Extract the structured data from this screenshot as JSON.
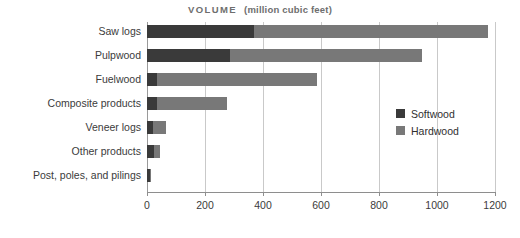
{
  "chart_data": {
    "type": "bar",
    "orientation": "horizontal",
    "stacked": true,
    "title_main": "VOLUME",
    "title_sub": "(million cubic feet)",
    "xlabel": "",
    "ylabel": "",
    "xlim": [
      0,
      1200
    ],
    "xticks": [
      0,
      200,
      400,
      600,
      800,
      1000,
      1200
    ],
    "xtick_labels": [
      "0",
      "200",
      "400",
      "600",
      "800",
      "1000",
      "1200"
    ],
    "grid": "vertical",
    "legend_position": "center-right",
    "categories": [
      "Saw logs",
      "Pulpwood",
      "Fuelwood",
      "Composite products",
      "Veneer logs",
      "Other products",
      "Post, poles, and pilings"
    ],
    "series": [
      {
        "name": "Softwood",
        "color": "#3a3a3a",
        "values": [
          370,
          285,
          35,
          35,
          20,
          25,
          12
        ]
      },
      {
        "name": "Hardwood",
        "color": "#787878",
        "values": [
          805,
          665,
          550,
          240,
          45,
          20,
          3
        ]
      }
    ],
    "totals": [
      1175,
      950,
      585,
      275,
      65,
      45,
      15
    ]
  },
  "legend": {
    "items": [
      {
        "label": "Softwood",
        "swatch": "softwood-swatch"
      },
      {
        "label": "Hardwood",
        "swatch": "hardwood-swatch"
      }
    ]
  }
}
